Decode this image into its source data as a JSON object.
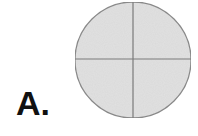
{
  "label": "A.",
  "figure": {
    "shape": "circle divided into four quadrants",
    "center": [
      133,
      60
    ],
    "radius": 58,
    "fill": "#e2e2e2",
    "stroke": "#8c8c8c",
    "divisions": 4
  }
}
